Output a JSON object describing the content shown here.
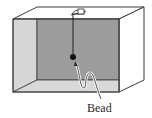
{
  "figure": {
    "type": "physics-diagram",
    "labels": {
      "bead": "Bead"
    },
    "colors": {
      "outline": "#3a3a3a",
      "back_wall": "#9c9c9c",
      "side_wall": "#d6d6d6",
      "floor": "#d9d9d9",
      "right_face": "#ffffff",
      "top_face": "#ffffff",
      "bead": "#111111",
      "string": "#222222",
      "background": "#ffffff"
    }
  }
}
